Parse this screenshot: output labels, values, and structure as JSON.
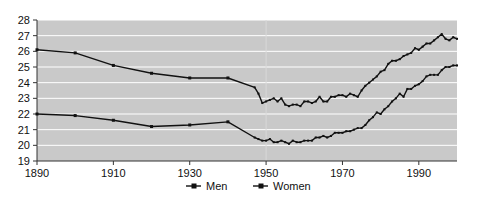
{
  "chart_data": {
    "type": "line",
    "title": "",
    "subtitle": "",
    "xlabel": "",
    "ylabel": "",
    "xlim": [
      1890,
      2000
    ],
    "ylim": [
      19,
      28
    ],
    "grid": "horizontal",
    "legend_position": "bottom-center",
    "plot_background": "#c9c9c9",
    "line_color": "#111111",
    "gridline_color": "#ffffff",
    "axis_color": "#333333",
    "y_ticks": [
      19,
      20,
      21,
      22,
      23,
      24,
      25,
      26,
      27,
      28
    ],
    "y_tick_labels": [
      "19",
      "20",
      "21",
      "22",
      "23",
      "24",
      "25",
      "26",
      "27",
      "28"
    ],
    "x_ticks": [
      1890,
      1910,
      1930,
      1950,
      1970,
      1990
    ],
    "x_tick_labels": [
      "1890",
      "1910",
      "1930",
      "1950",
      "1970",
      "1990"
    ],
    "legend": [
      {
        "name": "Men",
        "marker": "square",
        "color": "#111111"
      },
      {
        "name": "Women",
        "marker": "square",
        "color": "#111111"
      }
    ],
    "series": [
      {
        "name": "Men",
        "marker": "square",
        "color": "#111111",
        "points": [
          [
            1890,
            26.1
          ],
          [
            1900,
            25.9
          ],
          [
            1910,
            25.1
          ],
          [
            1920,
            24.6
          ],
          [
            1930,
            24.3
          ],
          [
            1940,
            24.3
          ],
          [
            1947,
            23.7
          ],
          [
            1948,
            23.3
          ],
          [
            1949,
            22.7
          ],
          [
            1950,
            22.8
          ],
          [
            1951,
            22.9
          ],
          [
            1952,
            23.0
          ],
          [
            1953,
            22.8
          ],
          [
            1954,
            23.0
          ],
          [
            1955,
            22.6
          ],
          [
            1956,
            22.5
          ],
          [
            1957,
            22.6
          ],
          [
            1958,
            22.6
          ],
          [
            1959,
            22.5
          ],
          [
            1960,
            22.8
          ],
          [
            1961,
            22.8
          ],
          [
            1962,
            22.7
          ],
          [
            1963,
            22.8
          ],
          [
            1964,
            23.1
          ],
          [
            1965,
            22.8
          ],
          [
            1966,
            22.8
          ],
          [
            1967,
            23.1
          ],
          [
            1968,
            23.1
          ],
          [
            1969,
            23.2
          ],
          [
            1970,
            23.2
          ],
          [
            1971,
            23.1
          ],
          [
            1972,
            23.3
          ],
          [
            1973,
            23.2
          ],
          [
            1974,
            23.1
          ],
          [
            1975,
            23.5
          ],
          [
            1976,
            23.8
          ],
          [
            1977,
            24.0
          ],
          [
            1978,
            24.2
          ],
          [
            1979,
            24.4
          ],
          [
            1980,
            24.7
          ],
          [
            1981,
            24.8
          ],
          [
            1982,
            25.2
          ],
          [
            1983,
            25.4
          ],
          [
            1984,
            25.4
          ],
          [
            1985,
            25.5
          ],
          [
            1986,
            25.7
          ],
          [
            1987,
            25.8
          ],
          [
            1988,
            25.9
          ],
          [
            1989,
            26.2
          ],
          [
            1990,
            26.1
          ],
          [
            1991,
            26.3
          ],
          [
            1992,
            26.5
          ],
          [
            1993,
            26.5
          ],
          [
            1994,
            26.7
          ],
          [
            1995,
            26.9
          ],
          [
            1996,
            27.1
          ],
          [
            1997,
            26.8
          ],
          [
            1998,
            26.7
          ],
          [
            1999,
            26.9
          ],
          [
            2000,
            26.8
          ]
        ]
      },
      {
        "name": "Women",
        "marker": "square",
        "color": "#111111",
        "points": [
          [
            1890,
            22.0
          ],
          [
            1900,
            21.9
          ],
          [
            1910,
            21.6
          ],
          [
            1920,
            21.2
          ],
          [
            1930,
            21.3
          ],
          [
            1940,
            21.5
          ],
          [
            1947,
            20.5
          ],
          [
            1948,
            20.4
          ],
          [
            1949,
            20.3
          ],
          [
            1950,
            20.3
          ],
          [
            1951,
            20.4
          ],
          [
            1952,
            20.2
          ],
          [
            1953,
            20.2
          ],
          [
            1954,
            20.3
          ],
          [
            1955,
            20.2
          ],
          [
            1956,
            20.1
          ],
          [
            1957,
            20.3
          ],
          [
            1958,
            20.2
          ],
          [
            1959,
            20.2
          ],
          [
            1960,
            20.3
          ],
          [
            1961,
            20.3
          ],
          [
            1962,
            20.3
          ],
          [
            1963,
            20.5
          ],
          [
            1964,
            20.5
          ],
          [
            1965,
            20.6
          ],
          [
            1966,
            20.5
          ],
          [
            1967,
            20.6
          ],
          [
            1968,
            20.8
          ],
          [
            1969,
            20.8
          ],
          [
            1970,
            20.8
          ],
          [
            1971,
            20.9
          ],
          [
            1972,
            20.9
          ],
          [
            1973,
            21.0
          ],
          [
            1974,
            21.1
          ],
          [
            1975,
            21.1
          ],
          [
            1976,
            21.3
          ],
          [
            1977,
            21.6
          ],
          [
            1978,
            21.8
          ],
          [
            1979,
            22.1
          ],
          [
            1980,
            22.0
          ],
          [
            1981,
            22.3
          ],
          [
            1982,
            22.5
          ],
          [
            1983,
            22.8
          ],
          [
            1984,
            23.0
          ],
          [
            1985,
            23.3
          ],
          [
            1986,
            23.1
          ],
          [
            1987,
            23.6
          ],
          [
            1988,
            23.6
          ],
          [
            1989,
            23.8
          ],
          [
            1990,
            23.9
          ],
          [
            1991,
            24.1
          ],
          [
            1992,
            24.4
          ],
          [
            1993,
            24.5
          ],
          [
            1994,
            24.5
          ],
          [
            1995,
            24.5
          ],
          [
            1996,
            24.8
          ],
          [
            1997,
            25.0
          ],
          [
            1998,
            25.0
          ],
          [
            1999,
            25.1
          ],
          [
            2000,
            25.1
          ]
        ]
      }
    ]
  }
}
